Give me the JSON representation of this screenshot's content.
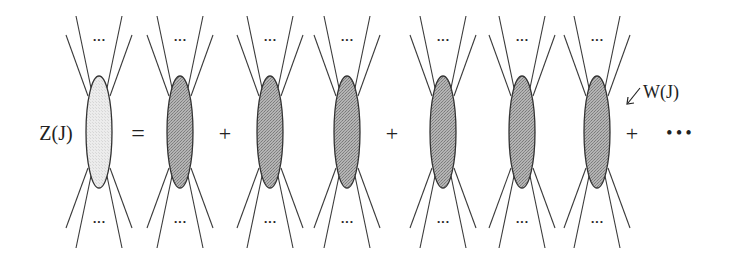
{
  "diagram": {
    "lhs": {
      "label": "Z(J)",
      "label_x": 56,
      "blob_cx": 99,
      "fill": "#e4e4e4"
    },
    "equals": {
      "symbol": "=",
      "x": 138
    },
    "blob_fill_connected": "#a9a9a9",
    "blob_stroke": "#333333",
    "blob_rx": 13,
    "blob_ry": 56,
    "blob_cy": 132,
    "leg_ellipsis": "···",
    "terms": [
      {
        "blobs": [
          180
        ]
      },
      {
        "blobs": [
          270,
          347
        ]
      },
      {
        "blobs": [
          443,
          522
        ]
      },
      {
        "blobs": [
          597
        ]
      }
    ],
    "plus_signs": [
      {
        "symbol": "+",
        "x": 225
      },
      {
        "symbol": "+",
        "x": 392
      },
      {
        "symbol": "+",
        "x": 632
      }
    ],
    "trailing_ellipsis": "• • •",
    "trailing_ellipsis_x": 679,
    "annotation": {
      "label": "W(J)",
      "x": 643,
      "y": 98,
      "arrow_from": [
        640,
        88
      ],
      "arrow_to": [
        627,
        104
      ]
    }
  }
}
